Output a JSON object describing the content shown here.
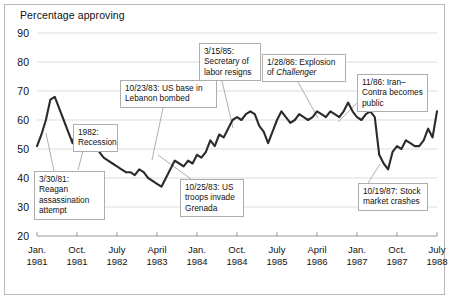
{
  "chart_data": {
    "type": "line",
    "title": "Percentage approving",
    "xlabel": "",
    "ylabel": "Percentage approving",
    "ylim": [
      20,
      90
    ],
    "yticks": [
      20,
      30,
      40,
      50,
      60,
      70,
      80,
      90
    ],
    "grid": true,
    "legend": "none",
    "xticks": [
      {
        "month": "Jan.",
        "year": "1981"
      },
      {
        "month": "Oct.",
        "year": "1981"
      },
      {
        "month": "July",
        "year": "1982"
      },
      {
        "month": "April",
        "year": "1983"
      },
      {
        "month": "Jan.",
        "year": "1984"
      },
      {
        "month": "Oct.",
        "year": "1984"
      },
      {
        "month": "July",
        "year": "1985"
      },
      {
        "month": "April",
        "year": "1986"
      },
      {
        "month": "Jan.",
        "year": "1987"
      },
      {
        "month": "Oct.",
        "year": "1987"
      },
      {
        "month": "July",
        "year": "1988"
      }
    ],
    "xlim_months": [
      0,
      90
    ],
    "series": [
      {
        "name": "Presidential approval",
        "color": "#2b2b2b",
        "points": [
          [
            0,
            51
          ],
          [
            1,
            55
          ],
          [
            2,
            60
          ],
          [
            3,
            67
          ],
          [
            4,
            68
          ],
          [
            5,
            64
          ],
          [
            6,
            60
          ],
          [
            7,
            56
          ],
          [
            8,
            52
          ],
          [
            9,
            58
          ],
          [
            10,
            56
          ],
          [
            11,
            54
          ],
          [
            12,
            57
          ],
          [
            13,
            51
          ],
          [
            14,
            49
          ],
          [
            15,
            47
          ],
          [
            16,
            46
          ],
          [
            17,
            45
          ],
          [
            18,
            44
          ],
          [
            19,
            43
          ],
          [
            20,
            42
          ],
          [
            21,
            42
          ],
          [
            22,
            41
          ],
          [
            23,
            43
          ],
          [
            24,
            42
          ],
          [
            25,
            40
          ],
          [
            26,
            39
          ],
          [
            27,
            38
          ],
          [
            28,
            37
          ],
          [
            29,
            40
          ],
          [
            30,
            43
          ],
          [
            31,
            46
          ],
          [
            32,
            45
          ],
          [
            33,
            44
          ],
          [
            34,
            46
          ],
          [
            35,
            45
          ],
          [
            36,
            48
          ],
          [
            37,
            47
          ],
          [
            38,
            49
          ],
          [
            39,
            53
          ],
          [
            40,
            51
          ],
          [
            41,
            55
          ],
          [
            42,
            54
          ],
          [
            43,
            57
          ],
          [
            44,
            60
          ],
          [
            45,
            61
          ],
          [
            46,
            60
          ],
          [
            47,
            62
          ],
          [
            48,
            63
          ],
          [
            49,
            62
          ],
          [
            50,
            58
          ],
          [
            51,
            56
          ],
          [
            52,
            52
          ],
          [
            53,
            56
          ],
          [
            54,
            60
          ],
          [
            55,
            63
          ],
          [
            56,
            61
          ],
          [
            57,
            59
          ],
          [
            58,
            60
          ],
          [
            59,
            62
          ],
          [
            60,
            61
          ],
          [
            61,
            60
          ],
          [
            62,
            61
          ],
          [
            63,
            63
          ],
          [
            64,
            62
          ],
          [
            65,
            61
          ],
          [
            66,
            63
          ],
          [
            67,
            62
          ],
          [
            68,
            61
          ],
          [
            69,
            63
          ],
          [
            70,
            66
          ],
          [
            71,
            63
          ],
          [
            72,
            61
          ],
          [
            73,
            60
          ],
          [
            74,
            62
          ],
          [
            75,
            63
          ],
          [
            76,
            61
          ],
          [
            77,
            48
          ],
          [
            78,
            45
          ],
          [
            79,
            43
          ],
          [
            80,
            49
          ],
          [
            81,
            51
          ],
          [
            82,
            50
          ],
          [
            83,
            53
          ],
          [
            84,
            52
          ],
          [
            85,
            51
          ],
          [
            86,
            51
          ],
          [
            87,
            53
          ],
          [
            88,
            57
          ],
          [
            89,
            54
          ],
          [
            90,
            63
          ]
        ]
      }
    ],
    "annotations": [
      {
        "id": "reagan-assassination",
        "lines": [
          "3/30/81: Reagan",
          "assassination",
          "attempt"
        ],
        "box": {
          "x": 34,
          "y": 171,
          "w": 71,
          "h": 38
        },
        "leader": [
          [
            54,
            171
          ],
          [
            46,
            133
          ]
        ]
      },
      {
        "id": "recession-1982",
        "lines": [
          "1982:",
          "Recession"
        ],
        "box": {
          "x": 73,
          "y": 124,
          "w": 45,
          "h": 27
        },
        "leader": [
          [
            83,
            151
          ],
          [
            78,
            170
          ]
        ]
      },
      {
        "id": "lebanon-bombing",
        "lines": [
          "10/23/83: US base in",
          "Lebanon bombed"
        ],
        "box": {
          "x": 120,
          "y": 80,
          "w": 97,
          "h": 28
        },
        "leader": [
          [
            163,
            108
          ],
          [
            152,
            160
          ]
        ]
      },
      {
        "id": "grenada-invasion",
        "lines": [
          "10/25/83: US",
          "troops invade",
          "Grenada"
        ],
        "box": {
          "x": 180,
          "y": 179,
          "w": 64,
          "h": 38
        },
        "leader": [
          [
            191,
            179
          ],
          [
            158,
            155
          ]
        ]
      },
      {
        "id": "labor-secretary-resigns",
        "lines": [
          "3/15/85:",
          "Secretary of",
          "labor resigns"
        ],
        "box": {
          "x": 199,
          "y": 43,
          "w": 62,
          "h": 38
        },
        "leader": [
          [
            222,
            81
          ],
          [
            233,
            128
          ]
        ]
      },
      {
        "id": "challenger-explosion",
        "lines": [
          "1/28/86: Explosion",
          "of <em>Challenger</em>"
        ],
        "box": {
          "x": 262,
          "y": 54,
          "w": 84,
          "h": 28
        },
        "leader": [
          [
            298,
            82
          ],
          [
            318,
            118
          ]
        ]
      },
      {
        "id": "iran-contra",
        "lines": [
          "11/86: Iran–",
          "Contra becomes",
          "public"
        ],
        "box": {
          "x": 357,
          "y": 74,
          "w": 71,
          "h": 38
        },
        "leader": [
          [
            357,
            103
          ],
          [
            338,
            122
          ]
        ]
      },
      {
        "id": "stock-market-crash",
        "lines": [
          "10/19/87: Stock",
          "market crashes"
        ],
        "box": {
          "x": 358,
          "y": 183,
          "w": 70,
          "h": 28
        },
        "leader": [
          [
            368,
            183
          ],
          [
            380,
            164
          ]
        ]
      }
    ]
  }
}
